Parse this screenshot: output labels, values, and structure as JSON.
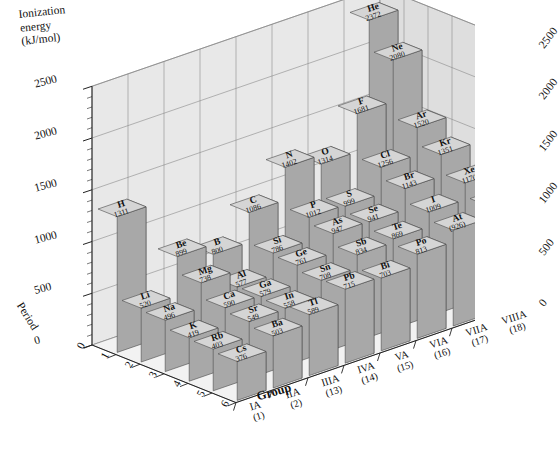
{
  "axes": {
    "y_title_line1": "Ionization",
    "y_title_line2": "energy",
    "y_title_line3": "(kJ/mol)",
    "y_ticks_left": [
      "2500",
      "2000",
      "1500",
      "1000",
      "500",
      "0"
    ],
    "y_ticks_right": [
      "2500",
      "2000",
      "1500",
      "1000",
      "500",
      "0"
    ],
    "period_title": "Period",
    "period_ticks": [
      "0",
      "1",
      "2",
      "3",
      "4",
      "5",
      "6"
    ],
    "group_title": "Group",
    "group_ticks": [
      {
        "roman": "IA",
        "num": "(1)"
      },
      {
        "roman": "IIA",
        "num": "(2)"
      },
      {
        "roman": "IIIA",
        "num": "(13)"
      },
      {
        "roman": "IVA",
        "num": "(14)"
      },
      {
        "roman": "VA",
        "num": "(15)"
      },
      {
        "roman": "VIA",
        "num": "(16)"
      },
      {
        "roman": "VIIA",
        "num": "(17)"
      },
      {
        "roman": "VIIIA",
        "num": "(18)"
      }
    ]
  },
  "chart_data": {
    "type": "bar",
    "title": "",
    "subtitle": "",
    "xlabel": "Group",
    "ylabel": "Ionization energy (kJ/mol)",
    "zlabel": "Period",
    "ylim": [
      0,
      2500
    ],
    "grid": true,
    "legend": "none",
    "projection": "3d-isometric",
    "categories_x": [
      "IA (1)",
      "IIA (2)",
      "IIIA (13)",
      "IVA (14)",
      "VA (15)",
      "VIA (16)",
      "VIIA (17)",
      "VIIIA (18)"
    ],
    "categories_z": [
      "1",
      "2",
      "3",
      "4",
      "5",
      "6"
    ],
    "bars": [
      {
        "symbol": "H",
        "value": 1311,
        "label": "1311",
        "group": 1,
        "period": 1
      },
      {
        "symbol": "He",
        "value": 2372,
        "label": "2372",
        "group": 8,
        "period": 1
      },
      {
        "symbol": "Li",
        "value": 520,
        "label": "520",
        "group": 1,
        "period": 2
      },
      {
        "symbol": "Be",
        "value": 899,
        "label": "899",
        "group": 2,
        "period": 2
      },
      {
        "symbol": "B",
        "value": 800,
        "label": "800",
        "group": 3,
        "period": 2
      },
      {
        "symbol": "C",
        "value": 1086,
        "label": "1086",
        "group": 4,
        "period": 2
      },
      {
        "symbol": "N",
        "value": 1402,
        "label": "1402",
        "group": 5,
        "period": 2
      },
      {
        "symbol": "O",
        "value": 1314,
        "label": "1314",
        "group": 6,
        "period": 2
      },
      {
        "symbol": "F",
        "value": 1681,
        "label": "1681",
        "group": 7,
        "period": 2
      },
      {
        "symbol": "Ne",
        "value": 2080,
        "label": "2080",
        "group": 8,
        "period": 2
      },
      {
        "symbol": "Na",
        "value": 496,
        "label": "496",
        "group": 1,
        "period": 3
      },
      {
        "symbol": "Mg",
        "value": 738,
        "label": "738",
        "group": 2,
        "period": 3
      },
      {
        "symbol": "Al",
        "value": 577,
        "label": "577",
        "group": 3,
        "period": 3
      },
      {
        "symbol": "Si",
        "value": 786,
        "label": "786",
        "group": 4,
        "period": 3
      },
      {
        "symbol": "P",
        "value": 1012,
        "label": "1012",
        "group": 5,
        "period": 3
      },
      {
        "symbol": "S",
        "value": 999,
        "label": "999",
        "group": 6,
        "period": 3
      },
      {
        "symbol": "Cl",
        "value": 1256,
        "label": "1256",
        "group": 7,
        "period": 3
      },
      {
        "symbol": "Ar",
        "value": 1520,
        "label": "1520",
        "group": 8,
        "period": 3
      },
      {
        "symbol": "K",
        "value": 419,
        "label": "419",
        "group": 1,
        "period": 4
      },
      {
        "symbol": "Ca",
        "value": 590,
        "label": "590",
        "group": 2,
        "period": 4
      },
      {
        "symbol": "Ga",
        "value": 579,
        "label": "579",
        "group": 3,
        "period": 4
      },
      {
        "symbol": "Ge",
        "value": 761,
        "label": "761",
        "group": 4,
        "period": 4
      },
      {
        "symbol": "As",
        "value": 947,
        "label": "947",
        "group": 5,
        "period": 4
      },
      {
        "symbol": "Se",
        "value": 941,
        "label": "941",
        "group": 6,
        "period": 4
      },
      {
        "symbol": "Br",
        "value": 1143,
        "label": "1143",
        "group": 7,
        "period": 4
      },
      {
        "symbol": "Kr",
        "value": 1351,
        "label": "1351",
        "group": 8,
        "period": 4
      },
      {
        "symbol": "Rb",
        "value": 403,
        "label": "403",
        "group": 1,
        "period": 5
      },
      {
        "symbol": "Sr",
        "value": 549,
        "label": "549",
        "group": 2,
        "period": 5
      },
      {
        "symbol": "In",
        "value": 558,
        "label": "558",
        "group": 3,
        "period": 5
      },
      {
        "symbol": "Sn",
        "value": 708,
        "label": "708",
        "group": 4,
        "period": 5
      },
      {
        "symbol": "Sb",
        "value": 834,
        "label": "834",
        "group": 5,
        "period": 5
      },
      {
        "symbol": "Te",
        "value": 869,
        "label": "869",
        "group": 6,
        "period": 5
      },
      {
        "symbol": "I",
        "value": 1009,
        "label": "1009",
        "group": 7,
        "period": 5
      },
      {
        "symbol": "Xe",
        "value": 1170,
        "label": "1170",
        "group": 8,
        "period": 5
      },
      {
        "symbol": "Cs",
        "value": 376,
        "label": "376",
        "group": 1,
        "period": 6
      },
      {
        "symbol": "Ba",
        "value": 503,
        "label": "503",
        "group": 2,
        "period": 6
      },
      {
        "symbol": "Tl",
        "value": 589,
        "label": "589",
        "group": 3,
        "period": 6
      },
      {
        "symbol": "Pb",
        "value": 715,
        "label": "715",
        "group": 4,
        "period": 6
      },
      {
        "symbol": "Bi",
        "value": 703,
        "label": "703",
        "group": 5,
        "period": 6
      },
      {
        "symbol": "Po",
        "value": 813,
        "label": "813",
        "group": 6,
        "period": 6
      },
      {
        "symbol": "At",
        "value": 926,
        "label": "(926)",
        "group": 7,
        "period": 6
      },
      {
        "symbol": "Rn",
        "value": 1037,
        "label": "1037",
        "group": 8,
        "period": 6
      }
    ]
  },
  "colors": {
    "top_face": "#d5d5d5",
    "front_face": "#a8a8a8",
    "side_face": "#8c8c8c",
    "wall_back": "#e8e8e8",
    "wall_side": "#dedede",
    "floor": "#f2f2f2",
    "grid_line": "#8a8a8a",
    "axis_line": "#222222",
    "text": "#111111",
    "background": "#ffffff"
  }
}
